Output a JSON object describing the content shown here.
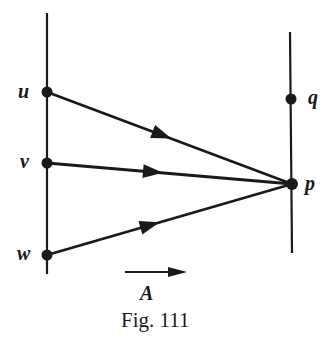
{
  "diagram": {
    "caption": "Fig. 111",
    "vector_label": "A",
    "points": {
      "u": {
        "label": "u",
        "x": 47,
        "y": 92
      },
      "v": {
        "label": "v",
        "x": 47,
        "y": 163
      },
      "w": {
        "label": "w",
        "x": 47,
        "y": 255
      },
      "q": {
        "label": "q",
        "x": 291,
        "y": 99
      },
      "p": {
        "label": "p",
        "x": 292,
        "y": 184
      }
    },
    "left_line": {
      "x": 47,
      "y1": 13,
      "y2": 274
    },
    "right_line": {
      "x1": 290,
      "y1": 32,
      "x2": 292,
      "y2": 253
    },
    "edges": [
      {
        "from": "u",
        "to": "p",
        "arrow_at": [
          160,
          135
        ]
      },
      {
        "from": "v",
        "to": "p",
        "arrow_at": [
          152,
          172
        ]
      },
      {
        "from": "w",
        "to": "p",
        "arrow_at": [
          150,
          224
        ]
      }
    ],
    "stroke_color": "#1a1a1a",
    "background": "#ffffff"
  }
}
